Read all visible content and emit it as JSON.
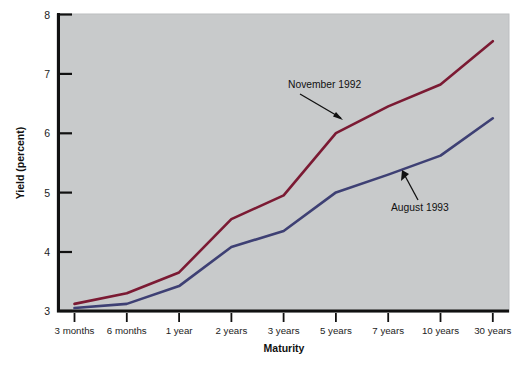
{
  "chart_data": {
    "type": "line",
    "title": "",
    "xlabel": "Maturity",
    "ylabel": "Yield (percent)",
    "categories": [
      "3 months",
      "6 months",
      "1 year",
      "2 years",
      "3 years",
      "5 years",
      "7 years",
      "10 years",
      "30 years"
    ],
    "ylim": [
      3,
      8
    ],
    "yticks": [
      "3",
      "4",
      "5",
      "6",
      "7",
      "8"
    ],
    "grid": false,
    "legend_position": "inline-annotations",
    "series": [
      {
        "name": "November 1992",
        "color": "#7b1a33",
        "values": [
          3.12,
          3.3,
          3.65,
          4.55,
          4.95,
          6.0,
          6.45,
          6.82,
          7.55
        ]
      },
      {
        "name": "August 1993",
        "color": "#3e4074",
        "values": [
          3.05,
          3.12,
          3.42,
          4.08,
          4.35,
          5.0,
          5.3,
          5.62,
          6.25
        ]
      }
    ],
    "annotations": [
      {
        "text": "November 1992",
        "series": "November 1992"
      },
      {
        "text": "August 1993",
        "series": "August 1993"
      }
    ]
  },
  "axes": {
    "y_title": "Yield (percent)",
    "x_title": "Maturity",
    "y_ticks": [
      "3",
      "4",
      "5",
      "6",
      "7",
      "8"
    ],
    "x_ticks": [
      "3 months",
      "6 months",
      "1 year",
      "2 years",
      "3 years",
      "5 years",
      "7 years",
      "10 years",
      "30 years"
    ]
  },
  "annotations": {
    "november": "November 1992",
    "august": "August 1993"
  },
  "colors": {
    "november_line": "#7b1a33",
    "august_line": "#3e4074",
    "plot_background": "#c8cacb",
    "axis": "#111111",
    "page_background": "#ffffff"
  }
}
